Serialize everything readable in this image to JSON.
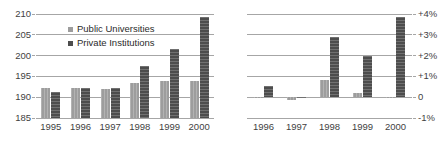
{
  "chart_data": [
    {
      "panel": "left",
      "type": "bar",
      "title": "",
      "xlabel": "",
      "ylabel": "",
      "categories": [
        "1995",
        "1996",
        "1997",
        "1998",
        "1999",
        "2000"
      ],
      "series": [
        {
          "name": "Public Universities",
          "color": "#9d9d9d",
          "values": [
            192.3,
            192.2,
            191.9,
            193.5,
            194.0,
            194.0
          ]
        },
        {
          "name": "Private Institutions",
          "color": "#4d4d4d",
          "values": [
            191.3,
            192.3,
            192.2,
            197.6,
            201.6,
            209.3
          ]
        }
      ],
      "ylim": [
        185,
        210
      ],
      "yticks": [
        185,
        190,
        195,
        200,
        205,
        210
      ],
      "ytick_labels": [
        "185",
        "190",
        "195",
        "200",
        "205",
        "210"
      ],
      "grid": true,
      "legend": [
        "Public Universities",
        "Private Institutions"
      ],
      "legend_position": "inside-top-left"
    },
    {
      "panel": "right",
      "type": "bar",
      "title": "",
      "xlabel": "",
      "ylabel": "",
      "categories": [
        "1996",
        "1997",
        "1998",
        "1999",
        "2000"
      ],
      "series": [
        {
          "name": "Public Universities",
          "color": "#9d9d9d",
          "values": [
            -0.05,
            -0.15,
            0.85,
            0.2,
            -0.04
          ]
        },
        {
          "name": "Private Institutions",
          "color": "#4d4d4d",
          "values": [
            0.55,
            -0.05,
            2.9,
            2.0,
            3.85
          ]
        }
      ],
      "ylim": [
        -1,
        4
      ],
      "yticks": [
        -1,
        0,
        1,
        2,
        3,
        4
      ],
      "ytick_labels": [
        "-1%",
        "0",
        "+1%",
        "+2%",
        "+3%",
        "+4%"
      ],
      "grid": true,
      "legend": [],
      "legend_position": "none"
    }
  ],
  "left_chart": {
    "legend": {
      "public_label": "Public Universities",
      "private_label": "Private Institutions"
    },
    "y_axis": {
      "labels": [
        "210",
        "205",
        "200",
        "195",
        "190",
        "185"
      ]
    },
    "x_axis": {
      "labels": [
        "1995",
        "1996",
        "1997",
        "1998",
        "1999",
        "2000"
      ]
    }
  },
  "right_chart": {
    "y_axis": {
      "labels": [
        "+4%",
        "+3%",
        "+2%",
        "+1%",
        "0",
        "-1%"
      ]
    },
    "x_axis": {
      "labels": [
        "1996",
        "1997",
        "1998",
        "1999",
        "2000"
      ]
    }
  },
  "colors": {
    "public": "#9d9d9d",
    "private": "#4d4d4d",
    "gridline": "#a6a6a6",
    "text": "#3f3f3f",
    "background": "#ffffff"
  }
}
